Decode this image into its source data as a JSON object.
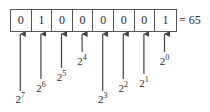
{
  "diagram": {
    "bits": [
      "0",
      "1",
      "0",
      "0",
      "0",
      "0",
      "0",
      "1"
    ],
    "result_label": "= 65",
    "place_values": [
      {
        "base": "2",
        "exp": "7"
      },
      {
        "base": "2",
        "exp": "6"
      },
      {
        "base": "2",
        "exp": "5"
      },
      {
        "base": "2",
        "exp": "4"
      },
      {
        "base": "2",
        "exp": "3"
      },
      {
        "base": "2",
        "exp": "2"
      },
      {
        "base": "2",
        "exp": "1"
      },
      {
        "base": "2",
        "exp": "0"
      }
    ],
    "colors": {
      "line": "#444444",
      "text": "#2a2a2a",
      "border": "#555555"
    }
  }
}
